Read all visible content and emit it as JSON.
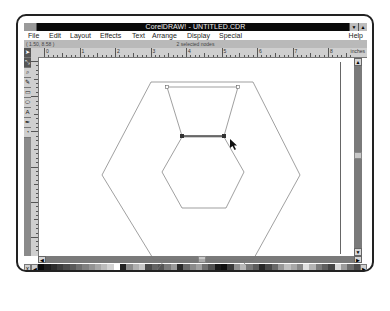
{
  "window": {
    "title": "CorelDRAW! - UNTITLED.CDR",
    "minimize_icon": "minimize-arrow",
    "maximize_icon": "maximize-arrow"
  },
  "menu": {
    "left": [
      {
        "label": "File"
      },
      {
        "label": "Edit"
      },
      {
        "label": "Layout"
      },
      {
        "label": "Effects"
      },
      {
        "label": "Text"
      },
      {
        "label": "Arrange"
      },
      {
        "label": "Display"
      },
      {
        "label": "Special"
      }
    ],
    "right": {
      "label": "Help"
    }
  },
  "status": {
    "coordinates": "( 1.50, 8.58 )",
    "message": "2 selected nodes"
  },
  "ruler": {
    "unit": "inches",
    "numbers": [
      "0",
      "1",
      "2",
      "3",
      "4",
      "5",
      "6",
      "7",
      "8"
    ]
  },
  "tools": [
    {
      "name": "pick-tool",
      "glyph": "➤"
    },
    {
      "name": "shape-tool",
      "glyph": "⤡"
    },
    {
      "name": "zoom-tool",
      "glyph": "⌕"
    },
    {
      "name": "pencil-tool",
      "glyph": "✎"
    },
    {
      "name": "rectangle-tool",
      "glyph": "▭"
    },
    {
      "name": "ellipse-tool",
      "glyph": "⬭"
    },
    {
      "name": "text-tool",
      "glyph": "A"
    },
    {
      "name": "outline-tool",
      "glyph": "✒"
    },
    {
      "name": "fill-tool",
      "glyph": "◔"
    }
  ],
  "palette": {
    "none_label": "X",
    "colors": [
      "#0a0a0a",
      "#1e1e1e",
      "#2d2d2d",
      "#3c3c3c",
      "#4b4b4b",
      "#5a5a5a",
      "#6e6e6e",
      "#808080",
      "#939393",
      "#a7a7a7",
      "#bcbcbc",
      "#d2d2d2",
      "#ffffff",
      "#222222",
      "#8c8c8c",
      "#b0b0b0",
      "#c8c8c8",
      "#4a4a4a",
      "#646464",
      "#555555",
      "#7a7a7a",
      "#9a9a9a",
      "#2a2a2a",
      "#6a6a6a",
      "#8a8a8a",
      "#a0a0a0",
      "#707070",
      "#505050",
      "#1a1a1a",
      "#0f0f0f",
      "#3a3a3a",
      "#909090",
      "#b8b8b8",
      "#787878",
      "#5c5c5c",
      "#282828",
      "#484848",
      "#686868",
      "#989898",
      "#c0c0c0",
      "#a8a8a8",
      "#888888",
      "#e0e0e0",
      "#b4b4b4",
      "#7c7c7c",
      "#606060",
      "#444444",
      "#d8d8d8",
      "#9c9c9c",
      "#6c6c6c",
      "#4c4c4c"
    ]
  },
  "drawing": {
    "description": "Outer hexagon with inner hexagon; trapezoid connecting top of inner hexagon to top of outer; bottom segment of selection edge with 2 selected nodes; cursor arrow",
    "selected_nodes": 2
  }
}
